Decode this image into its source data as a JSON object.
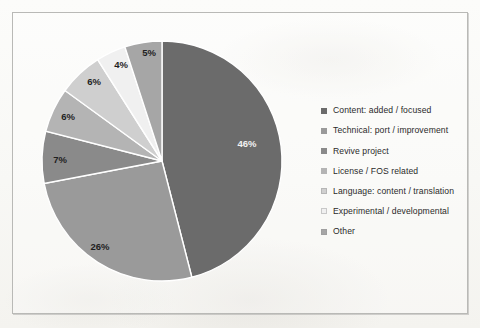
{
  "chart_data": {
    "type": "pie",
    "title": "",
    "categories": [
      "Content: added / focused",
      "Technical: port / improvement",
      "Revive project",
      "License / FOS related",
      "Language: content / translation",
      "Experimental / developmental",
      "Other"
    ],
    "values": [
      46,
      26,
      7,
      6,
      6,
      4,
      5
    ],
    "value_labels": [
      "46%",
      "26%",
      "7%",
      "6%",
      "6%",
      "4%",
      "5%"
    ],
    "colors": [
      "#6b6b6b",
      "#9a9a9a",
      "#8a8a8a",
      "#b4b4b4",
      "#cfcfcf",
      "#f0f0f0",
      "#a6a6a6"
    ],
    "units": "percent",
    "legend_position": "right",
    "grid": false,
    "start_angle_deg": 0,
    "direction": "clockwise"
  },
  "legend": {
    "items": [
      {
        "label": "Content: added / focused",
        "color": "#6b6b6b"
      },
      {
        "label": "Technical: port / improvement",
        "color": "#9a9a9a"
      },
      {
        "label": "Revive project",
        "color": "#8a8a8a"
      },
      {
        "label": "License / FOS related",
        "color": "#b4b4b4"
      },
      {
        "label": "Language: content / translation",
        "color": "#cfcfcf"
      },
      {
        "label": "Experimental / developmental",
        "color": "#f0f0f0"
      },
      {
        "label": "Other",
        "color": "#a6a6a6"
      }
    ]
  },
  "slice_labels": [
    {
      "text": "46%",
      "x": 247,
      "y": 147,
      "light": true
    },
    {
      "text": "26%",
      "x": 100,
      "y": 250,
      "light": false
    },
    {
      "text": "7%",
      "x": 60,
      "y": 163,
      "light": false
    },
    {
      "text": "6%",
      "x": 68,
      "y": 120,
      "light": false
    },
    {
      "text": "6%",
      "x": 94,
      "y": 85,
      "light": false
    },
    {
      "text": "4%",
      "x": 121,
      "y": 68,
      "light": false
    },
    {
      "text": "5%",
      "x": 149,
      "y": 56,
      "light": false
    }
  ],
  "pie_geometry": {
    "cx": 162,
    "cy": 161,
    "r": 120
  }
}
